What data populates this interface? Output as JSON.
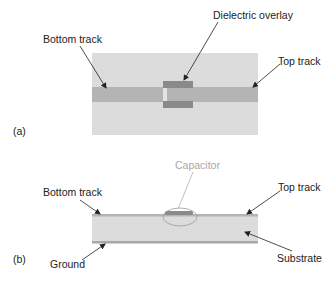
{
  "figure": {
    "panel_a": {
      "tag": "(a)",
      "labels": {
        "bottom_track": "Bottom track",
        "dielectric_overlay": "Dielectric overlay",
        "top_track": "Top track"
      }
    },
    "panel_b": {
      "tag": "(b)",
      "labels": {
        "bottom_track": "Bottom track",
        "capacitor": "Capacitor",
        "top_track": "Top track",
        "ground": "Ground",
        "substrate": "Substrate"
      }
    },
    "colors": {
      "substrate": "#dcdcdc",
      "track": "#b4b4b4",
      "overlay": "#8a8a8a",
      "ground": "#a8a8a8",
      "text": "#222222",
      "capacitor_label": "#a8a8a8"
    }
  }
}
